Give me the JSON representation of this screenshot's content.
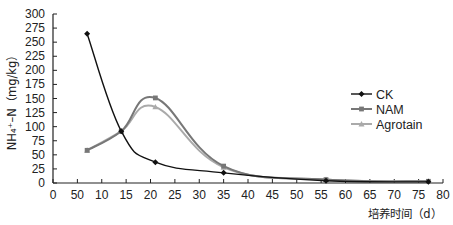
{
  "chart_data": {
    "type": "line",
    "title": "",
    "xlabel": "培养时间（d）",
    "ylabel": "NH₄⁺–N（mg/kg）",
    "xlim": [
      0,
      80
    ],
    "ylim": [
      0,
      300
    ],
    "x_ticks": [
      0,
      5,
      10,
      15,
      20,
      25,
      30,
      35,
      40,
      45,
      50,
      55,
      60,
      65,
      70,
      75,
      80
    ],
    "x_tick_labels": [
      "0",
      "50",
      "10",
      "15",
      "20",
      "25",
      "30",
      "35",
      "40",
      "45",
      "50",
      "55",
      "60",
      "65",
      "70",
      "75",
      "80"
    ],
    "y_ticks": [
      0,
      25,
      50,
      75,
      100,
      125,
      150,
      175,
      200,
      225,
      250,
      275,
      300
    ],
    "grid": false,
    "legend_position": "right-middle",
    "x": [
      7,
      14,
      21,
      35,
      56,
      77
    ],
    "series": [
      {
        "name": "CK",
        "color": "#111111",
        "marker": "diamond",
        "values": [
          265,
          92,
          37,
          18,
          4,
          2
        ]
      },
      {
        "name": "NAM",
        "color": "#777777",
        "marker": "square",
        "values": [
          58,
          92,
          151,
          30,
          6,
          3
        ]
      },
      {
        "name": "Agrotain",
        "color": "#aaaaaa",
        "marker": "triangle",
        "values": [
          58,
          92,
          135,
          28,
          6,
          3
        ]
      }
    ]
  }
}
